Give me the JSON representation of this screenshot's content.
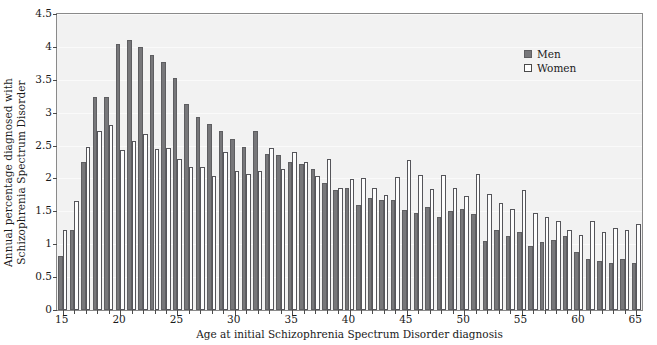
{
  "chart_data": {
    "type": "bar",
    "title": "",
    "subtitle": "",
    "xlabel": "Age at initial Schizophrenia Spectrum Disorder diagnosis",
    "ylabel": "Annual percentage diagnosed with Schizophrenia Spectrum Disorder",
    "ylabel_line1": "Annual percentage diagnosed with",
    "ylabel_line2": "Schizophrenia Spectrum Disorder",
    "ylim": [
      0,
      4.5
    ],
    "xlim": [
      14.5,
      65.5
    ],
    "ytick_values": [
      0,
      0.5,
      1,
      1.5,
      2,
      2.5,
      3,
      3.5,
      4,
      4.5
    ],
    "ytick_labels": [
      "0",
      "0.5",
      "1",
      "1.5",
      "2",
      "2.5",
      "3",
      "3.5",
      "4",
      "4.5"
    ],
    "xtick_values": [
      15,
      20,
      25,
      30,
      35,
      40,
      45,
      50,
      55,
      60,
      65
    ],
    "xtick_labels": [
      "15",
      "20",
      "25",
      "30",
      "35",
      "40",
      "45",
      "50",
      "55",
      "60",
      "65"
    ],
    "grid": false,
    "legend_position": "top-right",
    "categories": [
      15,
      16,
      17,
      18,
      19,
      20,
      21,
      22,
      23,
      24,
      25,
      26,
      27,
      28,
      29,
      30,
      31,
      32,
      33,
      34,
      35,
      36,
      37,
      38,
      39,
      40,
      41,
      42,
      43,
      44,
      45,
      46,
      47,
      48,
      49,
      50,
      51,
      52,
      53,
      54,
      55,
      56,
      57,
      58,
      59,
      60,
      61,
      62,
      63,
      64,
      65
    ],
    "series": [
      {
        "name": "Men",
        "color": "#77777a",
        "values": [
          0.82,
          1.21,
          2.25,
          3.24,
          3.24,
          4.05,
          4.1,
          4.0,
          3.88,
          3.77,
          3.52,
          3.13,
          2.93,
          2.83,
          2.72,
          2.6,
          2.48,
          2.72,
          2.37,
          2.35,
          2.25,
          2.22,
          2.14,
          1.93,
          1.83,
          1.85,
          1.6,
          1.7,
          1.67,
          1.67,
          1.52,
          1.48,
          1.57,
          1.42,
          1.5,
          1.54,
          1.46,
          1.05,
          1.22,
          1.12,
          1.18,
          0.97,
          1.03,
          1.07,
          1.12,
          0.88,
          0.77,
          0.74,
          0.71,
          0.78,
          0.72
        ]
      },
      {
        "name": "Women",
        "color": "#ffffff",
        "values": [
          1.21,
          1.65,
          2.48,
          2.72,
          2.82,
          2.43,
          2.57,
          2.68,
          2.45,
          2.46,
          2.3,
          2.17,
          2.18,
          2.03,
          2.4,
          2.11,
          2.07,
          2.12,
          2.46,
          2.14,
          2.4,
          2.25,
          2.03,
          2.3,
          1.85,
          1.99,
          2.01,
          1.86,
          1.75,
          2.02,
          2.28,
          2.05,
          1.84,
          2.05,
          1.85,
          1.73,
          2.07,
          1.77,
          1.62,
          1.53,
          1.83,
          1.48,
          1.41,
          1.35,
          1.22,
          1.14,
          1.36,
          1.19,
          1.24,
          1.22,
          1.31
        ]
      }
    ]
  },
  "legend": {
    "items": [
      {
        "label": "Men",
        "swatch": "filled-square",
        "color": "#77777a"
      },
      {
        "label": "Women",
        "swatch": "open-square",
        "color": "#ffffff"
      }
    ]
  },
  "axes": {
    "x_title": "Age at initial Schizophrenia Spectrum Disorder diagnosis",
    "y_title_line1": "Annual percentage diagnosed with",
    "y_title_line2": "Schizophrenia Spectrum Disorder"
  },
  "style": {
    "plot_background": "#f2f2f2",
    "figure_background": "#ffffff",
    "axis_color": "#8a8a8a",
    "men_color": "#77777a",
    "women_color": "#ffffff"
  }
}
